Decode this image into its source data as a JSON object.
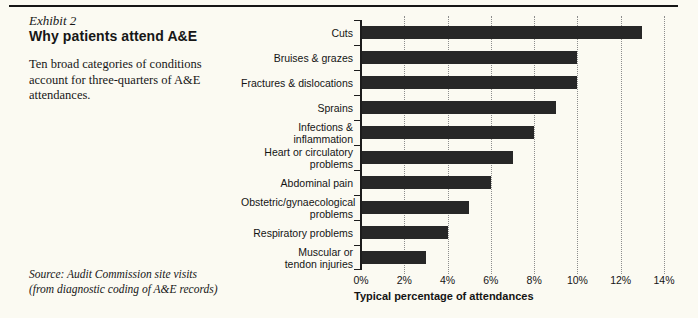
{
  "page": {
    "exhibit_label": "Exhibit 2",
    "title": "Why patients attend A&E",
    "description": "Ten broad categories of conditions account for three-quarters of A&E attendances.",
    "source_line1": "Source: Audit Commission site visits",
    "source_line2": "(from diagnostic coding of A&E records)"
  },
  "chart_data": {
    "type": "bar",
    "orientation": "horizontal",
    "categories": [
      "Cuts",
      "Bruises & grazes",
      "Fractures & dislocations",
      "Sprains",
      "Infections &\ninflammation",
      "Heart or circulatory\nproblems",
      "Abdominal pain",
      "Obstetric/gynaecological\nproblems",
      "Respiratory problems",
      "Muscular or\ntendon injuries"
    ],
    "values": [
      13,
      10,
      10,
      9,
      8,
      7,
      6,
      5,
      4,
      3
    ],
    "unit": "%",
    "xlabel": "Typical percentage of attendances",
    "x_ticks": [
      "0%",
      "2%",
      "4%",
      "6%",
      "8%",
      "10%",
      "12%",
      "14%"
    ],
    "xlim": [
      0,
      14
    ],
    "grid": "vertical-dotted",
    "legend": "none",
    "bar_color": "#272727",
    "background": "#fbfaf2"
  }
}
